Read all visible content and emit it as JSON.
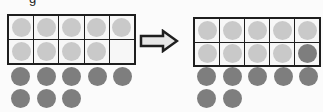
{
  "diagram": {
    "colors": {
      "frame": "#1e1e1e",
      "cell_bg": "#f7f7f7",
      "light_counter": "#c9c9c9",
      "dark_counter": "#7e7e7e",
      "arrow_fill": "#e6e6e6"
    },
    "left": {
      "cells": [
        "light",
        "light",
        "light",
        "light",
        "light",
        "light",
        "light",
        "light",
        "light",
        "empty"
      ],
      "loose_counters": 8
    },
    "arrow": {
      "direction": "right"
    },
    "right": {
      "cells": [
        "light",
        "light",
        "light",
        "light",
        "light",
        "light",
        "light",
        "light",
        "light",
        "dark"
      ],
      "loose_counters": 7
    },
    "top_partial_glyph": "g"
  }
}
